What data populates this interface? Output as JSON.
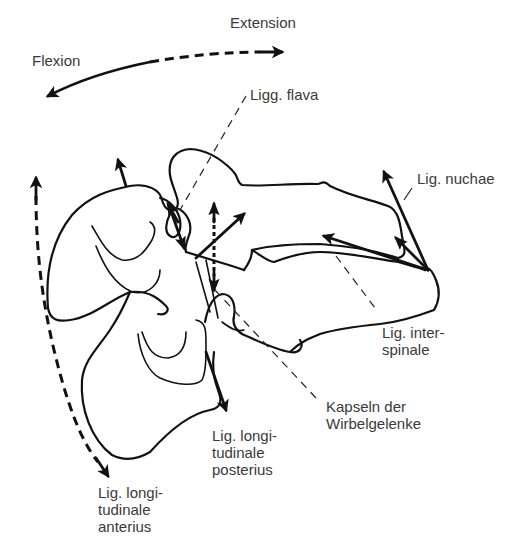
{
  "figure": {
    "type": "anatomical-line-drawing",
    "colors": {
      "line": "#111111",
      "text": "#3a3a3a",
      "background": "#ffffff"
    }
  },
  "motion": {
    "flexion": "Flexion",
    "extension": "Extension"
  },
  "labels": {
    "ligg_flava": "Ligg. flava",
    "lig_nuchae": "Lig. nuchae",
    "lig_interspinale": [
      "Lig. inter-",
      "spinale"
    ],
    "kapseln": [
      "Kapseln der",
      "Wirbelgelenke"
    ],
    "lig_long_posterius": [
      "Lig. longi-",
      "tudinale",
      "posterius"
    ],
    "lig_long_anterius": [
      "Lig. longi-",
      "tudinale",
      "anterius"
    ]
  }
}
